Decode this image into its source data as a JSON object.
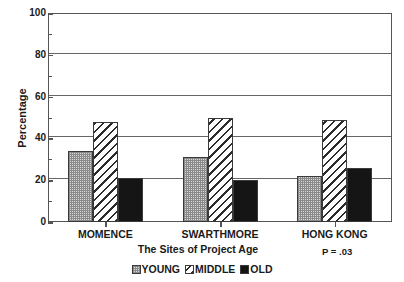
{
  "chart_data": {
    "type": "bar",
    "title": "",
    "subtitle": "",
    "xlabel": "The Sites of Project Age",
    "ylabel": "Percentage",
    "categories": [
      "MOMENCE",
      "SWARTHMORE",
      "HONG KONG"
    ],
    "series": [
      {
        "name": "YOUNG",
        "pattern": "dotted",
        "values": [
          34,
          31,
          22
        ]
      },
      {
        "name": "MIDDLE",
        "pattern": "diagonal-hatch",
        "values": [
          48,
          50,
          49
        ]
      },
      {
        "name": "OLD",
        "pattern": "solid-black",
        "values": [
          21,
          20,
          26
        ]
      }
    ],
    "ylim": [
      0,
      100
    ],
    "yticks": [
      0,
      20,
      40,
      60,
      80,
      100
    ],
    "ytick_labels": [
      "0",
      "20",
      "40",
      "60",
      "80",
      "100"
    ],
    "yticks_minor": [
      10,
      30,
      50,
      70,
      90
    ],
    "grid": true,
    "grid_axis": "y",
    "legend_position": "bottom-center",
    "annotations": [
      {
        "name": "p-value",
        "text": "P = .03"
      }
    ],
    "colors": {
      "axis": "#555555",
      "grid": "#666666",
      "bar_outline": "#3a3a3a",
      "young_fill": "#d8d8d8",
      "middle_fill": "#ffffff",
      "old_fill": "#151515",
      "text": "#1a1a1a",
      "background": "#ffffff"
    }
  }
}
